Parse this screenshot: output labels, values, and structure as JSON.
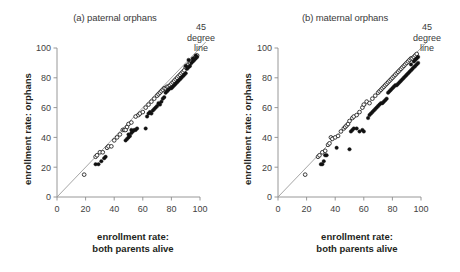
{
  "figure": {
    "background_color": "#ffffff",
    "text_color": "#231f20",
    "axis_color": "#8d8d8d",
    "reference_line_color": "#9b9b9b",
    "marker_filled_color": "#111111",
    "marker_open_color": "#ffffff"
  },
  "panels": [
    {
      "id": "a",
      "title": "(a) paternal orphans",
      "xlabel_line1": "enrollment rate:",
      "xlabel_line2": "both parents alive",
      "ylabel": "enrollment rate: orphans",
      "annotation_line1": "45",
      "annotation_line2": "degree",
      "annotation_line3": "line"
    },
    {
      "id": "b",
      "title": "(b) maternal orphans",
      "xlabel_line1": "enrollment rate:",
      "xlabel_line2": "both parents alive",
      "ylabel": "enrollment rate: orphans",
      "annotation_line1": "45",
      "annotation_line2": "degree",
      "annotation_line3": "line"
    }
  ],
  "chart_data": [
    {
      "type": "scatter",
      "panel": "a",
      "title": "(a) paternal orphans",
      "xlabel": "enrollment rate: both parents alive",
      "ylabel": "enrollment rate: orphans",
      "xlim": [
        0,
        100
      ],
      "ylim": [
        0,
        100
      ],
      "xticks": [
        0,
        20,
        40,
        60,
        80,
        100
      ],
      "yticks": [
        0,
        20,
        40,
        60,
        80,
        100
      ],
      "grid": false,
      "legend": "none",
      "annotations": [
        {
          "text": "45 degree line",
          "target": "identity-line",
          "position": "top-right"
        }
      ],
      "reference_line": {
        "type": "identity",
        "slope": 1,
        "intercept": 0,
        "from": [
          0,
          0
        ],
        "to": [
          100,
          100
        ]
      },
      "series": [
        {
          "name": "open-circles",
          "marker": "open circle",
          "points": [
            [
              19,
              15
            ],
            [
              27,
              27
            ],
            [
              28,
              28
            ],
            [
              30,
              30
            ],
            [
              32,
              30
            ],
            [
              35,
              33
            ],
            [
              36,
              34
            ],
            [
              38,
              34
            ],
            [
              40,
              38
            ],
            [
              42,
              40
            ],
            [
              44,
              42
            ],
            [
              46,
              45
            ],
            [
              47,
              45
            ],
            [
              48,
              45
            ],
            [
              49,
              47
            ],
            [
              50,
              49
            ],
            [
              52,
              50
            ],
            [
              55,
              54
            ],
            [
              57,
              55
            ],
            [
              58,
              56
            ],
            [
              60,
              57
            ],
            [
              62,
              60
            ],
            [
              64,
              62
            ],
            [
              66,
              64
            ],
            [
              68,
              66
            ],
            [
              70,
              68
            ],
            [
              71,
              69
            ],
            [
              72,
              70
            ],
            [
              73,
              71
            ],
            [
              74,
              72
            ],
            [
              75,
              73
            ],
            [
              76,
              73
            ],
            [
              77,
              74
            ],
            [
              78,
              74
            ],
            [
              79,
              75
            ],
            [
              80,
              76
            ],
            [
              81,
              77
            ],
            [
              82,
              78
            ],
            [
              83,
              79
            ],
            [
              84,
              80
            ],
            [
              85,
              81
            ],
            [
              86,
              82
            ],
            [
              87,
              83
            ],
            [
              88,
              84
            ],
            [
              89,
              85
            ],
            [
              90,
              87
            ],
            [
              91,
              88
            ],
            [
              92,
              89
            ],
            [
              93,
              90
            ],
            [
              94,
              91
            ],
            [
              95,
              92
            ],
            [
              96,
              93
            ],
            [
              97,
              94
            ],
            [
              98,
              95
            ]
          ]
        },
        {
          "name": "filled-circles",
          "marker": "filled circle",
          "points": [
            [
              27,
              22
            ],
            [
              29,
              22
            ],
            [
              31,
              24
            ],
            [
              33,
              26
            ],
            [
              34,
              27
            ],
            [
              48,
              38
            ],
            [
              49,
              39
            ],
            [
              50,
              40
            ],
            [
              50,
              42
            ],
            [
              51,
              41
            ],
            [
              52,
              43
            ],
            [
              52,
              45
            ],
            [
              53,
              44
            ],
            [
              54,
              45
            ],
            [
              55,
              45
            ],
            [
              56,
              46
            ],
            [
              62,
              46
            ],
            [
              63,
              54
            ],
            [
              64,
              56
            ],
            [
              65,
              57
            ],
            [
              66,
              56
            ],
            [
              67,
              58
            ],
            [
              68,
              59
            ],
            [
              69,
              60
            ],
            [
              70,
              61
            ],
            [
              71,
              63
            ],
            [
              72,
              62
            ],
            [
              73,
              64
            ],
            [
              74,
              66
            ],
            [
              75,
              67
            ],
            [
              76,
              70
            ],
            [
              77,
              71
            ],
            [
              78,
              72
            ],
            [
              79,
              73
            ],
            [
              80,
              73
            ],
            [
              81,
              74
            ],
            [
              82,
              75
            ],
            [
              83,
              76
            ],
            [
              84,
              77
            ],
            [
              85,
              78
            ],
            [
              86,
              79
            ],
            [
              87,
              80
            ],
            [
              88,
              81
            ],
            [
              89,
              82
            ],
            [
              90,
              83
            ],
            [
              90,
              88
            ],
            [
              91,
              86
            ],
            [
              92,
              87
            ],
            [
              92,
              92
            ],
            [
              93,
              88
            ],
            [
              94,
              90
            ],
            [
              95,
              91
            ],
            [
              95,
              93
            ],
            [
              96,
              92
            ],
            [
              97,
              93
            ],
            [
              97,
              95
            ],
            [
              98,
              94
            ]
          ]
        }
      ]
    },
    {
      "type": "scatter",
      "panel": "b",
      "title": "(b) maternal orphans",
      "xlabel": "enrollment rate: both parents alive",
      "ylabel": "enrollment rate: orphans",
      "xlim": [
        0,
        100
      ],
      "ylim": [
        0,
        100
      ],
      "xticks": [
        0,
        20,
        40,
        60,
        80,
        100
      ],
      "yticks": [
        0,
        20,
        40,
        60,
        80,
        100
      ],
      "grid": false,
      "legend": "none",
      "annotations": [
        {
          "text": "45 degree line",
          "target": "identity-line",
          "position": "top-right"
        }
      ],
      "reference_line": {
        "type": "identity",
        "slope": 1,
        "intercept": 0,
        "from": [
          0,
          0
        ],
        "to": [
          100,
          100
        ]
      },
      "series": [
        {
          "name": "open-circles",
          "marker": "open circle",
          "points": [
            [
              19,
              15
            ],
            [
              28,
              27
            ],
            [
              29,
              28
            ],
            [
              31,
              30
            ],
            [
              33,
              31
            ],
            [
              35,
              35
            ],
            [
              36,
              36
            ],
            [
              37,
              40
            ],
            [
              38,
              39
            ],
            [
              40,
              40
            ],
            [
              42,
              41
            ],
            [
              44,
              44
            ],
            [
              46,
              46
            ],
            [
              47,
              47
            ],
            [
              48,
              48
            ],
            [
              49,
              49
            ],
            [
              50,
              51
            ],
            [
              52,
              53
            ],
            [
              53,
              54
            ],
            [
              55,
              55
            ],
            [
              57,
              57
            ],
            [
              59,
              60
            ],
            [
              60,
              62
            ],
            [
              62,
              64
            ],
            [
              64,
              63
            ],
            [
              66,
              66
            ],
            [
              68,
              68
            ],
            [
              70,
              70
            ],
            [
              71,
              71
            ],
            [
              72,
              72
            ],
            [
              73,
              73
            ],
            [
              74,
              74
            ],
            [
              75,
              75
            ],
            [
              76,
              76
            ],
            [
              77,
              77
            ],
            [
              78,
              78
            ],
            [
              79,
              79
            ],
            [
              80,
              80
            ],
            [
              81,
              81
            ],
            [
              82,
              82
            ],
            [
              83,
              83
            ],
            [
              84,
              84
            ],
            [
              85,
              85
            ],
            [
              86,
              86
            ],
            [
              87,
              87
            ],
            [
              88,
              88
            ],
            [
              89,
              89
            ],
            [
              90,
              90
            ],
            [
              91,
              91
            ],
            [
              92,
              92
            ],
            [
              93,
              93
            ],
            [
              94,
              93
            ],
            [
              95,
              94
            ],
            [
              96,
              95
            ],
            [
              97,
              96
            ]
          ]
        },
        {
          "name": "filled-circles",
          "marker": "filled circle",
          "points": [
            [
              30,
              22
            ],
            [
              31,
              22
            ],
            [
              32,
              24
            ],
            [
              33,
              28
            ],
            [
              34,
              28
            ],
            [
              41,
              33
            ],
            [
              50,
              32
            ],
            [
              51,
              44
            ],
            [
              52,
              45
            ],
            [
              53,
              46
            ],
            [
              55,
              46
            ],
            [
              57,
              44
            ],
            [
              59,
              45
            ],
            [
              60,
              44
            ],
            [
              63,
              53
            ],
            [
              64,
              55
            ],
            [
              65,
              56
            ],
            [
              66,
              57
            ],
            [
              67,
              58
            ],
            [
              68,
              59
            ],
            [
              69,
              60
            ],
            [
              70,
              61
            ],
            [
              71,
              62
            ],
            [
              72,
              63
            ],
            [
              73,
              63
            ],
            [
              74,
              64
            ],
            [
              75,
              65
            ],
            [
              76,
              66
            ],
            [
              77,
              70
            ],
            [
              78,
              71
            ],
            [
              79,
              72
            ],
            [
              80,
              73
            ],
            [
              81,
              74
            ],
            [
              82,
              75
            ],
            [
              83,
              75
            ],
            [
              84,
              76
            ],
            [
              85,
              77
            ],
            [
              86,
              78
            ],
            [
              87,
              79
            ],
            [
              88,
              80
            ],
            [
              89,
              81
            ],
            [
              90,
              82
            ],
            [
              91,
              83
            ],
            [
              92,
              84
            ],
            [
              93,
              85
            ],
            [
              93,
              89
            ],
            [
              94,
              86
            ],
            [
              95,
              87
            ],
            [
              95,
              91
            ],
            [
              96,
              88
            ],
            [
              96,
              92
            ],
            [
              97,
              89
            ],
            [
              97,
              93
            ],
            [
              98,
              90
            ],
            [
              98,
              94
            ]
          ]
        }
      ]
    }
  ]
}
